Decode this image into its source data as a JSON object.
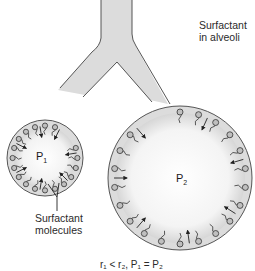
{
  "title_label": {
    "line1": "Surfactant",
    "line2": "in alveoli"
  },
  "small_alveolus": {
    "pressure_label": "P",
    "pressure_sub": "1",
    "center": [
      45,
      158
    ],
    "radius": 38,
    "molecule_count": 20
  },
  "large_alveolus": {
    "pressure_label": "P",
    "pressure_sub": "2",
    "center": [
      180,
      178
    ],
    "radius": 72,
    "molecule_count": 22
  },
  "callout": {
    "line1": "Surfactant",
    "line2": "molecules"
  },
  "equation": {
    "text": "r₁ < r₂, P₁ = P₂"
  },
  "colors": {
    "lumen_fill": "#dcdcdc",
    "outline": "#555555",
    "molecule_head": "#bfbfbf",
    "arrow": "#222222",
    "text": "#2a2a2a"
  }
}
